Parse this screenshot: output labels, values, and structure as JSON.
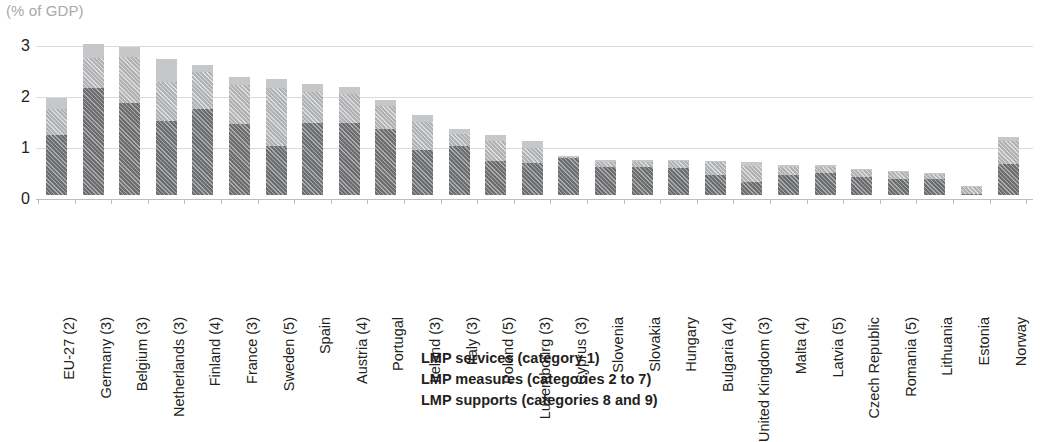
{
  "axis_title": "(% of GDP)",
  "legend": {
    "items": [
      {
        "label": "LMP services (category 1)",
        "key": "services",
        "color": "#c6c7c9"
      },
      {
        "label": "LMP measures (categories 2 to 7)",
        "key": "measures",
        "color": "#b0b2b4"
      },
      {
        "label": "LMP supports (categories 8 and 9)",
        "key": "supports",
        "color": "#6d6e70"
      }
    ]
  },
  "chart_data": {
    "type": "bar",
    "subtype": "stacked-bar",
    "title": "(% of GDP)",
    "xlabel": "",
    "ylabel": "(% of GDP)",
    "ylim": [
      0,
      3
    ],
    "yticks": [
      0,
      1,
      2,
      3
    ],
    "ytick_labels": [
      "0",
      "1",
      "2",
      "3"
    ],
    "grid": true,
    "legend_position": "bottom-center",
    "categories": [
      "EU-27 (2)",
      "Germany (3)",
      "Belgium (3)",
      "Netherlands (3)",
      "Finland (4)",
      "France (3)",
      "Sweden (5)",
      "Spain",
      "Austria (4)",
      "Portugal",
      "Ireland (3)",
      "Italy (3)",
      "Poland (5)",
      "Luxembourg (3)",
      "Cyprus (3)",
      "Slovenia",
      "Slovakia",
      "Hungary",
      "Bulgaria (4)",
      "United Kingdom (3)",
      "Malta (4)",
      "Latvia (5)",
      "Czech Republic",
      "Romania (5)",
      "Lithuania",
      "Estonia",
      "Norway"
    ],
    "series": [
      {
        "name": "LMP supports (categories 8 and 9)",
        "key": "supports",
        "color": "#6d6e70",
        "values": [
          1.18,
          2.1,
          1.81,
          1.46,
          1.69,
          1.4,
          0.97,
          1.42,
          1.41,
          1.29,
          0.88,
          0.97,
          0.67,
          0.63,
          0.72,
          0.55,
          0.54,
          0.52,
          0.4,
          0.25,
          0.39,
          0.43,
          0.36,
          0.32,
          0.31,
          0.02,
          0.6
        ]
      },
      {
        "name": "LMP measures (categories 2 to 7)",
        "key": "measures",
        "color": "#b0b2b4",
        "values": [
          0.5,
          0.58,
          0.89,
          0.76,
          0.73,
          0.76,
          1.12,
          0.6,
          0.57,
          0.46,
          0.55,
          0.23,
          0.39,
          0.3,
          0.02,
          0.1,
          0.11,
          0.14,
          0.24,
          0.31,
          0.16,
          0.12,
          0.14,
          0.13,
          0.1,
          0.14,
          0.46
        ]
      },
      {
        "name": "LMP services (category 1)",
        "key": "services",
        "color": "#c6c7c9",
        "values": [
          0.23,
          0.29,
          0.2,
          0.45,
          0.13,
          0.15,
          0.19,
          0.15,
          0.14,
          0.11,
          0.13,
          0.09,
          0.11,
          0.12,
          0.03,
          0.04,
          0.04,
          0.03,
          0.03,
          0.09,
          0.04,
          0.04,
          0.02,
          0.03,
          0.02,
          0.02,
          0.07
        ]
      }
    ],
    "totals": [
      1.91,
      2.97,
      2.9,
      2.67,
      2.55,
      2.31,
      2.28,
      2.17,
      2.12,
      1.86,
      1.56,
      1.29,
      1.17,
      1.05,
      0.77,
      0.69,
      0.69,
      0.69,
      0.67,
      0.65,
      0.59,
      0.59,
      0.52,
      0.48,
      0.43,
      0.18,
      1.13
    ]
  }
}
